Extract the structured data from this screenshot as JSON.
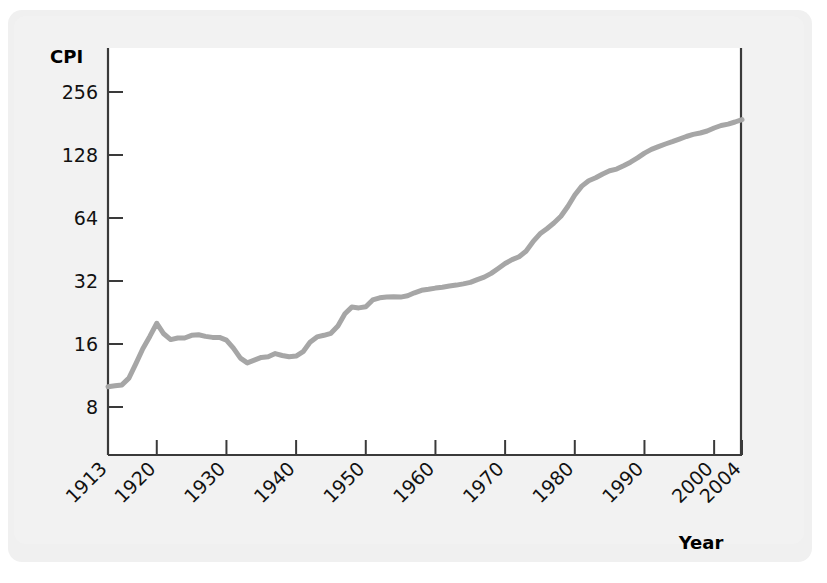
{
  "figure": {
    "y_axis_title": "CPI",
    "x_axis_title": "Year"
  },
  "chart_data": {
    "type": "line",
    "title": "",
    "subtitle": "",
    "xlabel": "Year",
    "ylabel": "CPI",
    "yscale": "log2",
    "ylim": [
      7,
      300
    ],
    "xlim": [
      1913,
      2004
    ],
    "grid": false,
    "legend": null,
    "y_ticks": [
      8,
      16,
      32,
      64,
      128,
      256
    ],
    "y_tick_labels": [
      "8",
      "16",
      "32",
      "64",
      "128",
      "256"
    ],
    "x_ticks": [
      1913,
      1920,
      1930,
      1940,
      1950,
      1960,
      1970,
      1980,
      1990,
      2000,
      2004
    ],
    "x_tick_labels": [
      "1913",
      "1920",
      "1930",
      "1940",
      "1950",
      "1960",
      "1970",
      "1980",
      "1990",
      "2000",
      "2004"
    ],
    "x_tick_rotation": 45,
    "line_color": "#a6a6a6",
    "series": [
      {
        "name": "CPI",
        "x": [
          1913,
          1914,
          1915,
          1916,
          1917,
          1918,
          1919,
          1920,
          1921,
          1922,
          1923,
          1924,
          1925,
          1926,
          1927,
          1928,
          1929,
          1930,
          1931,
          1932,
          1933,
          1934,
          1935,
          1936,
          1937,
          1938,
          1939,
          1940,
          1941,
          1942,
          1943,
          1944,
          1945,
          1946,
          1947,
          1948,
          1949,
          1950,
          1951,
          1952,
          1953,
          1954,
          1955,
          1956,
          1957,
          1958,
          1959,
          1960,
          1961,
          1962,
          1963,
          1964,
          1965,
          1966,
          1967,
          1968,
          1969,
          1970,
          1971,
          1972,
          1973,
          1974,
          1975,
          1976,
          1977,
          1978,
          1979,
          1980,
          1981,
          1982,
          1983,
          1984,
          1985,
          1986,
          1987,
          1988,
          1989,
          1990,
          1991,
          1992,
          1993,
          1994,
          1995,
          1996,
          1997,
          1998,
          1999,
          2000,
          2001,
          2002,
          2003,
          2004
        ],
        "values": [
          10.0,
          10.1,
          10.2,
          11.0,
          12.9,
          15.2,
          17.4,
          20.1,
          17.9,
          16.8,
          17.1,
          17.1,
          17.6,
          17.7,
          17.4,
          17.2,
          17.2,
          16.7,
          15.3,
          13.7,
          13.0,
          13.4,
          13.8,
          13.9,
          14.4,
          14.1,
          13.9,
          14.0,
          14.7,
          16.3,
          17.3,
          17.6,
          18.0,
          19.5,
          22.3,
          24.0,
          23.8,
          24.1,
          26.0,
          26.6,
          26.8,
          26.9,
          26.8,
          27.2,
          28.1,
          28.9,
          29.2,
          29.6,
          29.9,
          30.3,
          30.6,
          31.0,
          31.5,
          32.5,
          33.4,
          34.8,
          36.7,
          38.8,
          40.5,
          41.8,
          44.4,
          49.3,
          53.8,
          56.9,
          60.6,
          65.2,
          72.6,
          82.4,
          90.9,
          96.5,
          99.6,
          103.9,
          107.6,
          109.6,
          113.6,
          118.3,
          124.0,
          130.7,
          136.2,
          140.3,
          144.5,
          148.2,
          152.4,
          156.9,
          160.5,
          163.0,
          166.6,
          172.2,
          177.1,
          179.9,
          184.0,
          188.9
        ]
      }
    ]
  }
}
